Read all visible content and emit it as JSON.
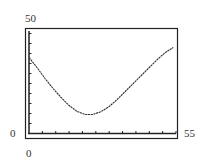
{
  "chart_data": {
    "type": "line",
    "title": "",
    "xlabel": "",
    "ylabel": "",
    "xlim": [
      0,
      55
    ],
    "ylim": [
      0,
      50
    ],
    "x_tick_labels": [
      "0",
      "55"
    ],
    "y_tick_labels": [
      "0",
      "50"
    ],
    "x_tick_count": 11,
    "y_tick_count": 10,
    "grid": false,
    "legend": null,
    "series": [
      {
        "name": "curve",
        "x": [
          0,
          3,
          6,
          9,
          12,
          15,
          18,
          21,
          24,
          27,
          30,
          33,
          36,
          39,
          42,
          45,
          48,
          51,
          54
        ],
        "y": [
          38,
          33,
          27.5,
          22.5,
          18,
          14,
          11,
          9.5,
          9.5,
          11,
          13.5,
          17,
          21,
          25,
          29,
          33,
          37,
          40.5,
          43
        ]
      }
    ]
  },
  "labels": {
    "y_max": "50",
    "y_min": "0",
    "x_min": "0",
    "x_max": "55"
  },
  "colors": {
    "axis": "#222222",
    "curve": "#333333"
  }
}
